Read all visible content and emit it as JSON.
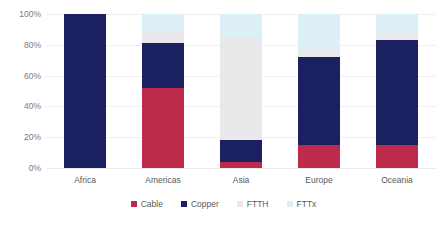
{
  "chart_data": {
    "type": "bar",
    "stacked": true,
    "title": "",
    "subtitle": "",
    "xlabel": "",
    "ylabel": "",
    "ylim": [
      0,
      100
    ],
    "ytick_labels": [
      "0%",
      "20%",
      "40%",
      "60%",
      "80%",
      "100%"
    ],
    "ytick_values": [
      0,
      20,
      40,
      60,
      80,
      100
    ],
    "grid": true,
    "legend_position": "bottom",
    "categories": [
      "Africa",
      "Americas",
      "Asia",
      "Europe",
      "Oceania"
    ],
    "series": [
      {
        "name": "Cable",
        "color": "#bd2b4c",
        "values": [
          0,
          52,
          4,
          15,
          15
        ]
      },
      {
        "name": "Copper",
        "color": "#1b2160",
        "values": [
          100,
          29,
          14,
          57,
          68
        ]
      },
      {
        "name": "FTTH",
        "color": "#e9e9eb",
        "values": [
          0,
          8,
          67,
          5,
          5
        ]
      },
      {
        "name": "FTTx",
        "color": "#ddeff7",
        "values": [
          0,
          11,
          15,
          23,
          12
        ]
      }
    ]
  },
  "axis": {
    "ticks": [
      {
        "label": "100%",
        "value": 100
      },
      {
        "label": "80%",
        "value": 80
      },
      {
        "label": "60%",
        "value": 60
      },
      {
        "label": "40%",
        "value": 40
      },
      {
        "label": "20%",
        "value": 20
      },
      {
        "label": "0%",
        "value": 0
      }
    ]
  },
  "legend": {
    "items": [
      {
        "label": "Cable",
        "color": "#bd2b4c"
      },
      {
        "label": "Copper",
        "color": "#1b2160"
      },
      {
        "label": "FTTH",
        "color": "#e9e9eb"
      },
      {
        "label": "FTTx",
        "color": "#ddeff7"
      }
    ]
  }
}
